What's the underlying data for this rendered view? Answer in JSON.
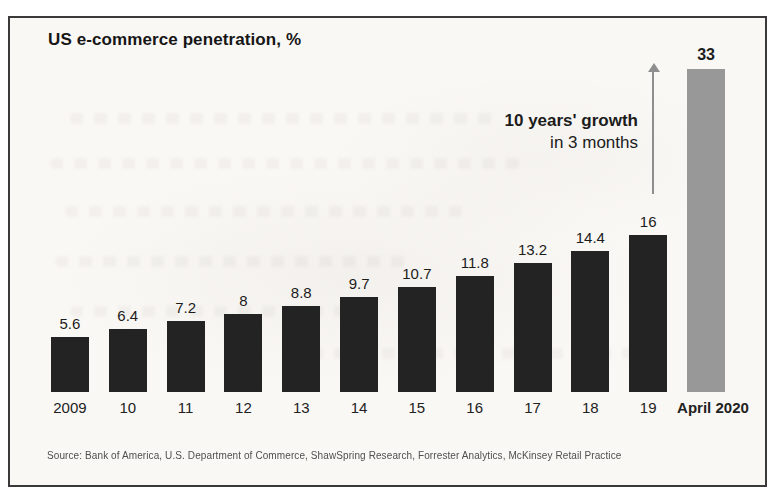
{
  "page": {
    "title": "US e-commerce penetration, %"
  },
  "annotation": {
    "line1": "10 years' growth",
    "line2": "in 3 months"
  },
  "source": "Source: Bank of America, U.S. Department of Commerce, ShawSpring Research, Forrester Analytics, McKinsey Retail Practice",
  "colors": {
    "bar_dark": "#232323",
    "bar_highlight": "#989898",
    "arrow": "#8e8e8e",
    "frame_border": "#3a3a3a",
    "paper": "#faf8f5",
    "text": "#1a1a1a",
    "source_text": "#4f4f4f"
  },
  "chart_data": {
    "type": "bar",
    "title": "US e-commerce penetration, %",
    "categories": [
      "2009",
      "10",
      "11",
      "12",
      "13",
      "14",
      "15",
      "16",
      "17",
      "18",
      "19",
      "April 2020"
    ],
    "values": [
      5.6,
      6.4,
      7.2,
      8,
      8.8,
      9.7,
      10.7,
      11.8,
      13.2,
      14.4,
      16,
      33
    ],
    "value_labels": [
      "5.6",
      "6.4",
      "7.2",
      "8",
      "8.8",
      "9.7",
      "10.7",
      "11.8",
      "13.2",
      "14.4",
      "16",
      "33"
    ],
    "highlight_index": 11,
    "xlabel": "",
    "ylabel": "US e-commerce penetration, %",
    "ylim": [
      0,
      34
    ],
    "grid": false,
    "legend": false,
    "annotation": "10 years' growth in 3 months",
    "annotation_target": "April 2020"
  }
}
